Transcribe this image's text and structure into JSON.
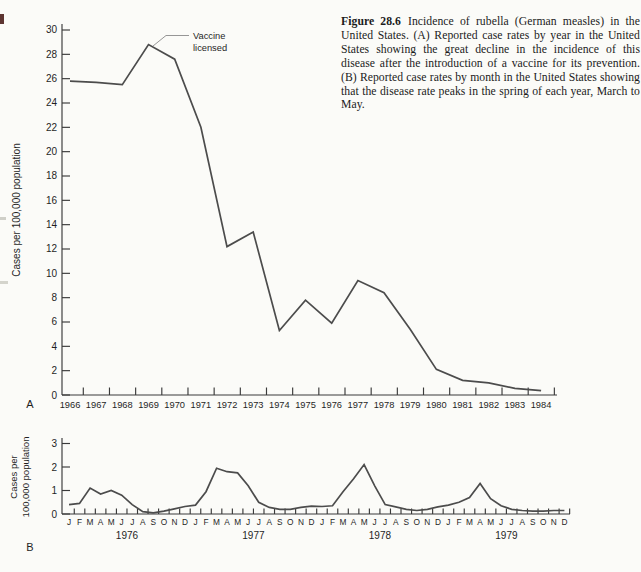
{
  "caption": {
    "label": "Figure 28.6",
    "text": "Incidence of rubella (German measles) in the United States. (A) Reported case rates by year in the United States showing the great decline in the incidence of this disease after the introduction of a vaccine for its prevention. (B) Reported case rates by month in the United States showing that the disease rate peaks in the spring of each year, March to May."
  },
  "labels": {
    "panel_a": "A",
    "panel_b": "B"
  },
  "colors": {
    "line": "#4c4c4c",
    "axis": "#3a3a3a",
    "text": "#1f1f1f",
    "background": "#fbfbf8"
  },
  "chart_data": [
    {
      "type": "line",
      "panel": "A",
      "title": "",
      "ylabel": "Cases per 100,000 population",
      "xlabel": "",
      "ylim": [
        0,
        30
      ],
      "ytick_step": 2,
      "grid": false,
      "legend": "none",
      "categories": [
        "1966",
        "1967",
        "1968",
        "1969",
        "1970",
        "1971",
        "1972",
        "1973",
        "1974",
        "1975",
        "1976",
        "1977",
        "1978",
        "1979",
        "1980",
        "1981",
        "1982",
        "1983",
        "1984"
      ],
      "values": [
        25.8,
        25.7,
        25.5,
        28.8,
        27.6,
        22.0,
        12.2,
        13.4,
        5.3,
        7.8,
        5.9,
        9.4,
        8.4,
        5.4,
        2.1,
        1.2,
        1.0,
        0.55,
        0.35
      ],
      "annotation_lines": [
        "Vaccine",
        "licensed"
      ],
      "annotation_points_to": "1969"
    },
    {
      "type": "line",
      "panel": "B",
      "title": "",
      "ylabel_lines": [
        "Cases per",
        "100,000 population"
      ],
      "xlabel": "",
      "ylim": [
        0,
        3
      ],
      "ytick_step": 1,
      "grid": false,
      "legend": "none",
      "month_labels": [
        "J",
        "F",
        "M",
        "A",
        "M",
        "J",
        "J",
        "A",
        "S",
        "O",
        "N",
        "D"
      ],
      "years": [
        "1976",
        "1977",
        "1978",
        "1979"
      ],
      "values": [
        0.4,
        0.45,
        1.1,
        0.85,
        1.0,
        0.8,
        0.4,
        0.1,
        0.05,
        0.12,
        0.22,
        0.32,
        0.38,
        0.95,
        1.95,
        1.8,
        1.75,
        1.2,
        0.5,
        0.28,
        0.2,
        0.2,
        0.28,
        0.33,
        0.32,
        0.35,
        0.95,
        1.5,
        2.1,
        1.2,
        0.4,
        0.3,
        0.2,
        0.15,
        0.2,
        0.3,
        0.38,
        0.5,
        0.7,
        1.3,
        0.65,
        0.35,
        0.2,
        0.15,
        0.12,
        0.12,
        0.15,
        0.15
      ]
    }
  ]
}
